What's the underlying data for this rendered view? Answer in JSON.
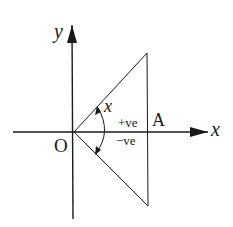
{
  "diagram": {
    "colors": {
      "line": "#1a1a1a",
      "background": "#ffffff"
    },
    "axes": {
      "x_label": "x",
      "y_label": "y"
    },
    "points": {
      "origin_label": "O",
      "point_a_label": "A"
    },
    "angle": {
      "label": "x",
      "sign_positive": "+ve",
      "sign_negative": "−ve"
    }
  }
}
